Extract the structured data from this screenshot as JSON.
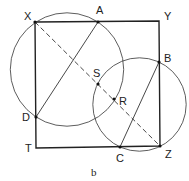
{
  "caption": "b",
  "colors": {
    "stroke": "#222222",
    "background": "#ffffff"
  },
  "square": {
    "vertices": {
      "X": [
        35,
        22
      ],
      "Y": [
        159,
        21
      ],
      "Z": [
        160,
        146
      ],
      "T": [
        36,
        148
      ]
    }
  },
  "points": {
    "X": {
      "label": "X",
      "pos": [
        35,
        22
      ],
      "label_pos": [
        24,
        20
      ]
    },
    "A": {
      "label": "A",
      "pos": [
        98,
        22
      ],
      "label_pos": [
        96,
        14
      ]
    },
    "Y": {
      "label": "Y",
      "pos": [
        159,
        21
      ],
      "label_pos": [
        164,
        20
      ]
    },
    "B": {
      "label": "B",
      "pos": [
        159,
        62
      ],
      "label_pos": [
        164,
        62
      ]
    },
    "S": {
      "label": "S",
      "pos": [
        98,
        84
      ],
      "label_pos": [
        93,
        77
      ]
    },
    "R": {
      "label": "R",
      "pos": [
        114,
        99
      ],
      "label_pos": [
        119,
        105
      ]
    },
    "D": {
      "label": "D",
      "pos": [
        36,
        117
      ],
      "label_pos": [
        22,
        121
      ]
    },
    "T": {
      "label": "T",
      "pos": [
        36,
        148
      ],
      "label_pos": [
        25,
        152
      ]
    },
    "C": {
      "label": "C",
      "pos": [
        120,
        147
      ],
      "label_pos": [
        116,
        162
      ]
    },
    "Z": {
      "label": "Z",
      "pos": [
        160,
        146
      ],
      "label_pos": [
        165,
        158
      ]
    }
  },
  "circles": [
    {
      "name": "circle-AD",
      "center": [
        67,
        69.5
      ],
      "radius": 56.7
    },
    {
      "name": "circle-BC",
      "center": [
        139.5,
        104.5
      ],
      "radius": 46.7
    }
  ],
  "segments": [
    {
      "name": "chord-AD",
      "from": "A",
      "to": "D",
      "style": "solid"
    },
    {
      "name": "chord-BC",
      "from": "B",
      "to": "C",
      "style": "solid"
    },
    {
      "name": "diagonal-XZ",
      "from": "X",
      "to": "Z",
      "style": "dashed"
    }
  ]
}
